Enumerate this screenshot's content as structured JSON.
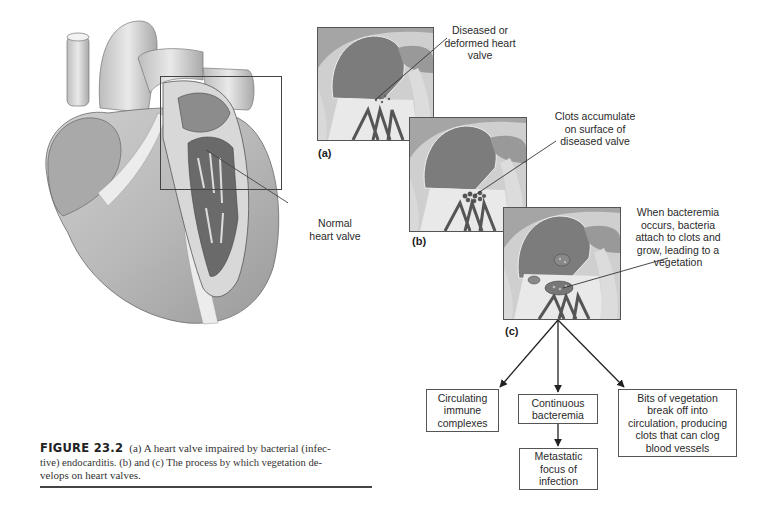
{
  "figure": {
    "number": "FIGURE 23.2",
    "caption": "(a) A heart valve impaired by bacterial (infective) endocarditis. (b) and (c) The process by which vegetation develops on heart valves.",
    "caption_lines": [
      "(a) A heart valve impaired by bacterial (infec-",
      "tive) endocarditis. (b) and (c) The process by which vegetation de-",
      "velops on heart valves."
    ]
  },
  "heart": {
    "callout": [
      "Normal",
      "heart valve"
    ]
  },
  "panels": [
    {
      "id": "a",
      "label": "(a)",
      "callout": [
        "Diseased or",
        "deformed heart",
        "valve"
      ]
    },
    {
      "id": "b",
      "label": "(b)",
      "callout": [
        "Clots accumulate",
        "on surface of",
        "diseased valve"
      ]
    },
    {
      "id": "c",
      "label": "(c)",
      "callout": [
        "When bacteremia",
        "occurs, bacteria",
        "attach to clots and",
        "grow, leading to a",
        "vegetation"
      ]
    }
  ],
  "flow": {
    "outcomes": [
      {
        "id": "immune",
        "lines": [
          "Circulating",
          "immune",
          "complexes"
        ]
      },
      {
        "id": "bacteremia",
        "lines": [
          "Continuous",
          "bacteremia"
        ]
      },
      {
        "id": "metastatic",
        "lines": [
          "Metastatic",
          "focus of",
          "infection"
        ]
      },
      {
        "id": "vegetation",
        "lines": [
          "Bits of vegetation",
          "break off into",
          "circulation, producing",
          "clots that can clog",
          "blood vessels"
        ]
      }
    ]
  },
  "colors": {
    "line": "#333333",
    "box_border": "#555555",
    "illustration_dark": "#5a5a5a",
    "illustration_mid": "#a8a8a8",
    "illustration_light": "#e6e6e6"
  }
}
